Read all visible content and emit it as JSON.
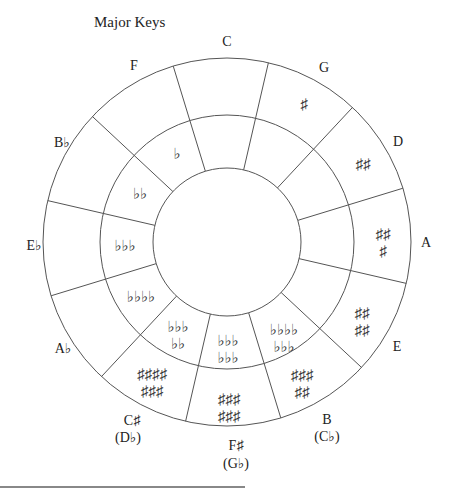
{
  "title": "Major Keys",
  "diagram": {
    "center": [
      227,
      242
    ],
    "radii": {
      "outer": 184,
      "middle": 127,
      "inner": 74
    },
    "stroke_color": "#555555",
    "segments": 12
  },
  "keys": [
    {
      "id": "C",
      "label": "C",
      "alt": "",
      "signature": "",
      "accidental": "none",
      "count": 0
    },
    {
      "id": "G",
      "label": "G",
      "alt": "",
      "signature": "♯",
      "accidental": "sharp",
      "count": 1
    },
    {
      "id": "D",
      "label": "D",
      "alt": "",
      "signature": "♯♯",
      "accidental": "sharp",
      "count": 2
    },
    {
      "id": "A",
      "label": "A",
      "alt": "",
      "signature": "♯♯\n♯",
      "accidental": "sharp",
      "count": 3
    },
    {
      "id": "E",
      "label": "E",
      "alt": "",
      "signature": "♯♯\n♯♯",
      "accidental": "sharp",
      "count": 4
    },
    {
      "id": "B",
      "label": "B",
      "alt": "(C♭)",
      "signature": "♯♯♯\n♯♯",
      "accidental": "sharp",
      "count": 5
    },
    {
      "id": "F#",
      "label": "F♯",
      "alt": "(G♭)",
      "signature": "♯♯♯\n♯♯♯",
      "accidental": "sharp",
      "count": 6
    },
    {
      "id": "C#",
      "label": "C♯",
      "alt": "(D♭)",
      "signature": "♯♯♯♯\n♯♯♯",
      "accidental": "sharp",
      "count": 7
    },
    {
      "id": "Ab",
      "label": "A♭",
      "alt": "",
      "signature": "♭♭♭\n♭♭",
      "accidental": "flat",
      "count": 4
    },
    {
      "id": "Eb",
      "label": "E♭",
      "alt": "",
      "signature": "♭♭♭",
      "accidental": "flat",
      "count": 3
    },
    {
      "id": "Bb",
      "label": "B♭",
      "alt": "",
      "signature": "♭♭",
      "accidental": "flat",
      "count": 2
    },
    {
      "id": "F",
      "label": "F",
      "alt": "",
      "signature": "♭",
      "accidental": "flat",
      "count": 1
    }
  ],
  "flat_inner_ring": [
    {
      "key": "F",
      "signature": "♭"
    },
    {
      "key": "Bb",
      "signature": "♭♭"
    },
    {
      "key": "Eb",
      "signature": "♭♭♭"
    },
    {
      "key": "Ab",
      "signature": "♭♭♭♭"
    },
    {
      "key": "Db",
      "signature": "♭♭♭\n♭♭"
    },
    {
      "key": "Gb",
      "signature": "♭♭♭\n♭♭♭"
    },
    {
      "key": "Cb",
      "signature": "♭♭♭♭\n♭♭♭"
    }
  ],
  "sharp_outer_ring": [
    {
      "key": "G",
      "signature": "♯"
    },
    {
      "key": "D",
      "signature": "♯♯"
    },
    {
      "key": "A",
      "signature": "♯♯\n♯"
    },
    {
      "key": "E",
      "signature": "♯♯\n♯♯"
    },
    {
      "key": "B",
      "signature": "♯♯♯\n♯♯"
    },
    {
      "key": "F#",
      "signature": "♯♯♯\n♯♯♯"
    },
    {
      "key": "C#",
      "signature": "♯♯♯♯\n♯♯♯"
    }
  ],
  "labels": {
    "C": "C",
    "G": "G",
    "D": "D",
    "A": "A",
    "E": "E",
    "B": "B",
    "B_alt": "(C♭)",
    "Fs": "F♯",
    "Fs_alt": "(G♭)",
    "Cs": "C♯",
    "Cs_alt": "(D♭)",
    "Ab": "A♭",
    "Eb": "E♭",
    "Bb": "B♭",
    "F": "F"
  }
}
